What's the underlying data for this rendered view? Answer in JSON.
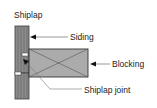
{
  "diagram": {
    "title": "Shiplap",
    "labels": {
      "siding": "Siding",
      "blocking": "Blocking",
      "joint": "Shiplap joint"
    },
    "colors": {
      "board": "#8a8a8a",
      "board_grain": "#5e5e5e",
      "blocking": "#a9a9a9",
      "outline": "#333333",
      "leader": "#666666"
    }
  }
}
